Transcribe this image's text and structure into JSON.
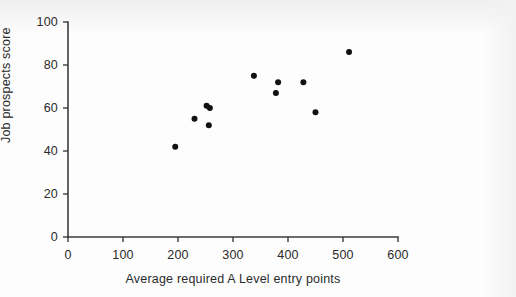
{
  "chart_data": {
    "type": "scatter",
    "title": "",
    "xlabel": "Average required A Level entry points",
    "ylabel": "Job prospects score",
    "xlim": [
      0,
      600
    ],
    "ylim": [
      0,
      100
    ],
    "xticks": [
      0,
      100,
      200,
      300,
      400,
      500,
      600
    ],
    "yticks": [
      0,
      20,
      40,
      60,
      80,
      100
    ],
    "xtick_labels": [
      "0",
      "100",
      "200",
      "300",
      "400",
      "500",
      "600"
    ],
    "ytick_labels": [
      "0",
      "20",
      "40",
      "60",
      "80",
      "100"
    ],
    "grid": false,
    "legend": null,
    "marker": {
      "shape": "circle",
      "color": "#111111",
      "size_px": 6
    },
    "series": [
      {
        "name": "Universities",
        "color": "#111111",
        "points": [
          {
            "x": 195,
            "y": 42
          },
          {
            "x": 230,
            "y": 55
          },
          {
            "x": 252,
            "y": 61
          },
          {
            "x": 258,
            "y": 60
          },
          {
            "x": 256,
            "y": 52
          },
          {
            "x": 338,
            "y": 75
          },
          {
            "x": 378,
            "y": 67
          },
          {
            "x": 382,
            "y": 72
          },
          {
            "x": 428,
            "y": 72
          },
          {
            "x": 450,
            "y": 58
          },
          {
            "x": 511,
            "y": 86
          }
        ]
      }
    ]
  },
  "plot_geometry": {
    "origin_px": {
      "x": 68,
      "y": 237
    },
    "x_unit_px": 0.55,
    "y_unit_px": 2.15,
    "x_axis_end_px": 398,
    "y_axis_top_px": 22
  }
}
